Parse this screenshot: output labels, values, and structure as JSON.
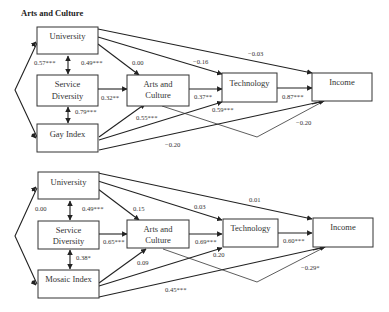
{
  "title": "Arts and Culture",
  "diagrams": [
    {
      "nodes": {
        "university": "University",
        "service_1": "Service",
        "service_2": "Diversity",
        "index": "Gay Index",
        "arts_1": "Arts and",
        "arts_2": "Culture",
        "technology": "Technology",
        "income": "Income"
      },
      "coefficients": {
        "univ_index_corr": "0.57***",
        "univ_service": "0.49***",
        "univ_arts": "0.00",
        "univ_tech": "−0.16",
        "univ_income": "−0.03",
        "service_arts": "0.32**",
        "service_index": "0.79***",
        "arts_tech": "0.37**",
        "tech_income": "0.87***",
        "index_arts": "0.55***",
        "index_tech": "0.59***",
        "arts_income": "−0.20",
        "index_income": "−0.20"
      }
    },
    {
      "nodes": {
        "university": "University",
        "service_1": "Service",
        "service_2": "Diversity",
        "index": "Mosaic Index",
        "arts_1": "Arts and",
        "arts_2": "Culture",
        "technology": "Technology",
        "income": "Income"
      },
      "coefficients": {
        "univ_index_corr": "0.00",
        "univ_service": "0.49***",
        "univ_arts": "0.15",
        "univ_tech": "0.03",
        "univ_income": "0.01",
        "service_arts": "0.65***",
        "service_index": "0.38*",
        "arts_tech": "0.69***",
        "tech_income": "0.60***",
        "index_arts": "0.09",
        "index_tech": "0.20",
        "arts_income": "−0.29*",
        "index_income": "0.45***"
      }
    }
  ]
}
